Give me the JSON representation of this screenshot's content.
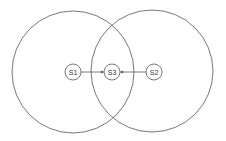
{
  "diagram": {
    "type": "coverage-overlap",
    "colors": {
      "stroke": "#555555",
      "background": "#ffffff",
      "text": "#333333"
    },
    "ranges": [
      {
        "id": "range-s1",
        "cx": 73,
        "cy": 72,
        "r": 61
      },
      {
        "id": "range-s2",
        "cx": 152,
        "cy": 71,
        "r": 61
      }
    ],
    "nodes": [
      {
        "id": "S1",
        "label": "S1",
        "cx": 73,
        "cy": 72,
        "r": 8
      },
      {
        "id": "S3",
        "label": "S3",
        "cx": 112,
        "cy": 72,
        "r": 8
      },
      {
        "id": "S2",
        "label": "S2",
        "cx": 154,
        "cy": 72,
        "r": 8
      }
    ],
    "edges": [
      {
        "from": "S1",
        "to": "S3"
      },
      {
        "from": "S2",
        "to": "S3"
      }
    ]
  }
}
